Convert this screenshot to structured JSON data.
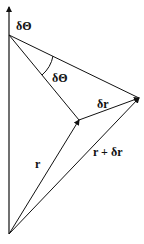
{
  "diagram": {
    "title": "",
    "labels": {
      "axis_angle": "δΘ",
      "angle_arc": "δΘ",
      "delta_r": "δr",
      "r": "r",
      "r_plus_delta_r": "r + δr"
    },
    "points": {
      "origin": [
        9,
        234
      ],
      "axis_top": [
        9,
        5
      ],
      "apex": [
        9,
        35
      ],
      "r_tip": [
        79,
        120
      ],
      "r_dr_tip": [
        139,
        98
      ]
    },
    "colors": {
      "stroke": "#111111",
      "background": "#ffffff"
    }
  }
}
